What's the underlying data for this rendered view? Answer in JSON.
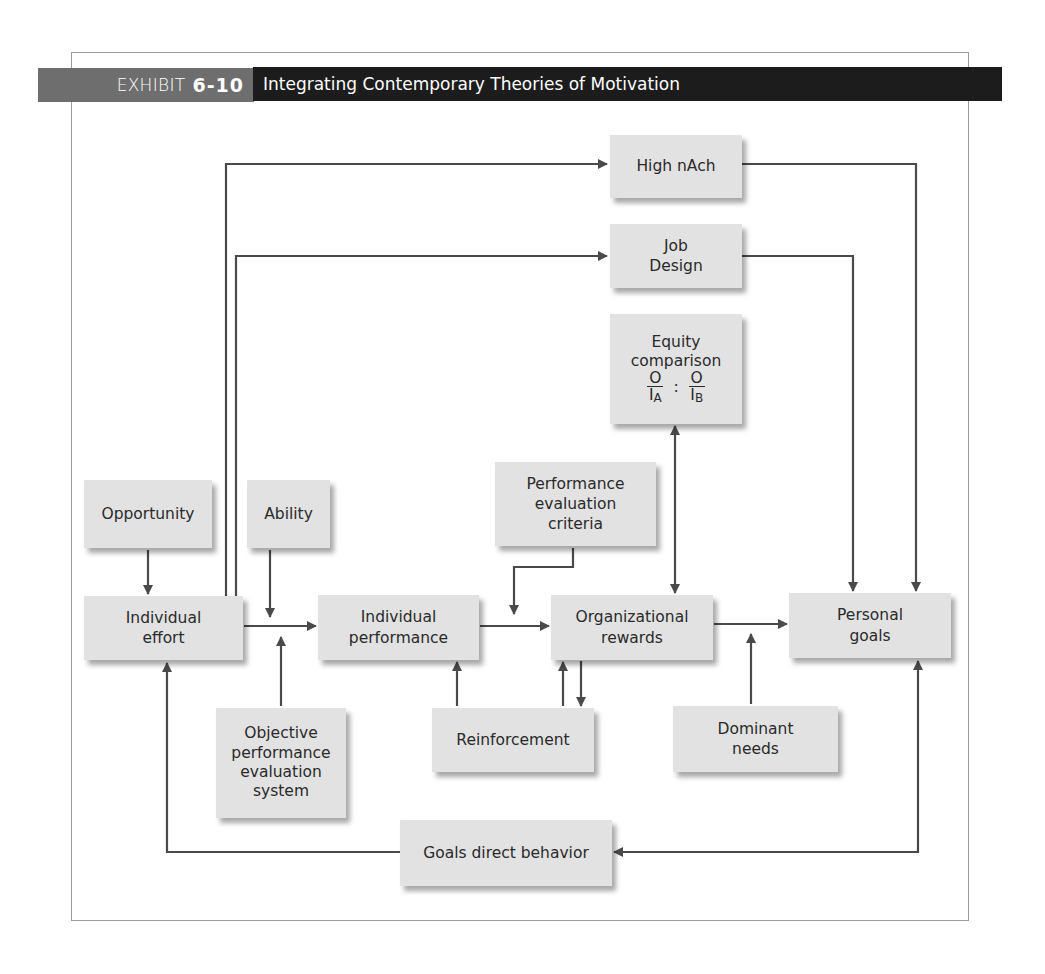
{
  "header": {
    "exhibit_label": "EXHIBIT",
    "exhibit_number": "6-10",
    "title": "Integrating Contemporary Theories of Motivation",
    "colors": {
      "label_bg": "#6e6e6e",
      "title_bg": "#1c1c1c",
      "text": "#ffffff"
    }
  },
  "nodes": {
    "high_nach": {
      "lines": [
        "High nAch"
      ]
    },
    "job_design": {
      "lines": [
        "Job",
        "Design"
      ]
    },
    "equity": {
      "lines": [
        "Equity",
        "comparison"
      ],
      "formula": {
        "left_num": "O",
        "left_den": "I",
        "left_sub": "A",
        "sep": ":",
        "right_num": "O",
        "right_den": "I",
        "right_sub": "B"
      }
    },
    "opportunity": {
      "lines": [
        "Opportunity"
      ]
    },
    "ability": {
      "lines": [
        "Ability"
      ]
    },
    "perf_eval_criteria": {
      "lines": [
        "Performance",
        "evaluation",
        "criteria"
      ]
    },
    "individual_effort": {
      "lines": [
        "Individual",
        "effort"
      ]
    },
    "individual_performance": {
      "lines": [
        "Individual",
        "performance"
      ]
    },
    "organizational_rewards": {
      "lines": [
        "Organizational",
        "rewards"
      ]
    },
    "personal_goals": {
      "lines": [
        "Personal",
        "goals"
      ]
    },
    "objective_system": {
      "lines": [
        "Objective",
        "performance",
        "evaluation",
        "system"
      ]
    },
    "reinforcement": {
      "lines": [
        "Reinforcement"
      ]
    },
    "dominant_needs": {
      "lines": [
        "Dominant",
        "needs"
      ]
    },
    "goals_direct_behavior": {
      "lines": [
        "Goals direct behavior"
      ]
    }
  },
  "edges": [
    {
      "from": "individual_effort",
      "to": "high_nach"
    },
    {
      "from": "individual_effort",
      "to": "job_design"
    },
    {
      "from": "high_nach",
      "to": "personal_goals"
    },
    {
      "from": "job_design",
      "to": "personal_goals"
    },
    {
      "from": "equity",
      "to": "organizational_rewards",
      "bidirectional": true
    },
    {
      "from": "opportunity",
      "to": "individual_effort"
    },
    {
      "from": "ability",
      "to": "individual_effort->individual_performance"
    },
    {
      "from": "objective_system",
      "to": "individual_effort->individual_performance"
    },
    {
      "from": "individual_effort",
      "to": "individual_performance"
    },
    {
      "from": "individual_performance",
      "to": "organizational_rewards"
    },
    {
      "from": "perf_eval_criteria",
      "to": "individual_performance->organizational_rewards"
    },
    {
      "from": "reinforcement",
      "to": "individual_performance"
    },
    {
      "from": "reinforcement",
      "to": "organizational_rewards"
    },
    {
      "from": "organizational_rewards",
      "to": "reinforcement"
    },
    {
      "from": "organizational_rewards",
      "to": "personal_goals"
    },
    {
      "from": "dominant_needs",
      "to": "organizational_rewards->personal_goals"
    },
    {
      "from": "personal_goals",
      "to": "goals_direct_behavior",
      "bidirectional": true
    },
    {
      "from": "goals_direct_behavior",
      "to": "individual_effort"
    }
  ],
  "colors": {
    "box_fill": "#e2e2e2",
    "line": "#4a4a4a",
    "frame": "#9a9a9a",
    "text": "#2a2a2a"
  }
}
